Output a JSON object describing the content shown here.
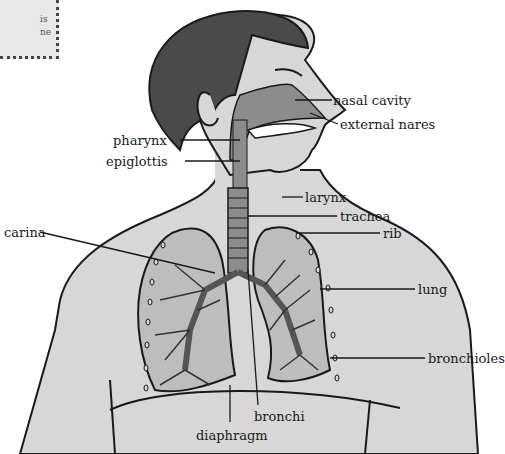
{
  "corner_fragment": {
    "lines": [
      "is",
      "ne"
    ]
  },
  "colors": {
    "skin": "#d7d7d7",
    "hair": "#4a4a4a",
    "airway": "#8c8c8c",
    "lung_fill": "#bdbdbd",
    "outline": "#1a1a1a",
    "background": "#ffffff"
  },
  "labels": {
    "nasal_cavity": "nasal cavity",
    "external_nares": "external nares",
    "pharynx": "pharynx",
    "epiglottis": "epiglottis",
    "larynx": "larynx",
    "trachea": "trachea",
    "rib": "rib",
    "carina": "carina",
    "lung": "lung",
    "bronchioles": "bronchioles",
    "bronchi": "bronchi",
    "diaphragm": "diaphragm"
  }
}
